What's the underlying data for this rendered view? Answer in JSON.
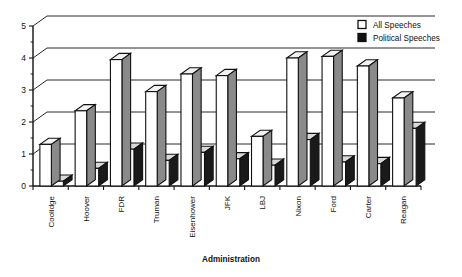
{
  "chart_data": {
    "type": "bar",
    "title": "",
    "xlabel": "Administration",
    "ylabel": "",
    "ylim": [
      0,
      5
    ],
    "yticks": [
      "0",
      "1",
      "2",
      "3",
      "4",
      "5"
    ],
    "grid": true,
    "legend_position": "top-right",
    "style": "3d-grouped-bar",
    "categories": [
      "Coolidge",
      "Hoover",
      "FDR",
      "Truman",
      "Eisenhower",
      "JFK",
      "LBJ",
      "Nixon",
      "Ford",
      "Carter",
      "Reagan"
    ],
    "series": [
      {
        "name": "All Speeches",
        "color": "#ffffff",
        "values": [
          1.3,
          2.35,
          3.95,
          2.95,
          3.5,
          3.45,
          1.55,
          4.0,
          4.05,
          3.75,
          2.75
        ]
      },
      {
        "name": "Political Speeches",
        "color": "#111111",
        "values": [
          0.15,
          0.55,
          1.15,
          0.8,
          1.05,
          0.85,
          0.65,
          1.45,
          0.75,
          0.7,
          1.8
        ]
      }
    ]
  },
  "legend": {
    "items": [
      {
        "label": "All Speeches",
        "swatch": "white-square"
      },
      {
        "label": "Political Speeches",
        "swatch": "black-square"
      }
    ]
  },
  "axis": {
    "x_title": "Administration"
  }
}
